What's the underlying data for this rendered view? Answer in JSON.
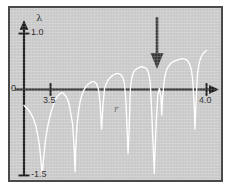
{
  "figure": {
    "background_color": "#ffffff",
    "plot_background_color": "#c9c9c9",
    "border_color": "#4a4a4a",
    "curve_color": "#ffffff",
    "axis_color": "#1c1c1c",
    "annotation_arrow_color": "#3a3a3a"
  },
  "labels": {
    "y_axis_symbol": "λ",
    "y_tick_top": "1.0",
    "y_tick_zero": "0",
    "y_tick_bottom": "-1.5",
    "x_axis_symbol": "r",
    "x_tick_left": "3.5",
    "x_tick_right": "4.0"
  },
  "annotations": [
    {
      "name": "period-3-window-arrow",
      "glyph": "down-arrow",
      "r": 3.8284,
      "description": "arrow marking period-3 window"
    }
  ],
  "chart_data": {
    "type": "line",
    "title": "",
    "subtitle": "",
    "xlabel": "r",
    "ylabel": "λ",
    "grid": false,
    "legend": null,
    "xlim": [
      3.4,
      4.02
    ],
    "ylim": [
      -1.5,
      1.0
    ],
    "xticks": [
      3.5,
      4.0
    ],
    "xticklabels": [
      "3.5",
      "4.0"
    ],
    "yticks": [
      -1.5,
      0,
      1.0
    ],
    "yticklabels": [
      "-1.5",
      "0",
      "1.0"
    ],
    "series": [
      {
        "name": "Lyapunov exponent of logistic map",
        "x": [
          3.4,
          3.41,
          3.42,
          3.43,
          3.44,
          3.45,
          3.455,
          3.46,
          3.465,
          3.47,
          3.475,
          3.48,
          3.485,
          3.49,
          3.495,
          3.5,
          3.505,
          3.51,
          3.515,
          3.52,
          3.525,
          3.53,
          3.535,
          3.54,
          3.545,
          3.55,
          3.56,
          3.565,
          3.568,
          3.57,
          3.575,
          3.58,
          3.585,
          3.59,
          3.595,
          3.6,
          3.605,
          3.61,
          3.615,
          3.62,
          3.625,
          3.63,
          3.635,
          3.64,
          3.645,
          3.65,
          3.655,
          3.66,
          3.665,
          3.67,
          3.675,
          3.68,
          3.685,
          3.69,
          3.695,
          3.7,
          3.705,
          3.71,
          3.715,
          3.72,
          3.725,
          3.73,
          3.735,
          3.74,
          3.742,
          3.745,
          3.748,
          3.75,
          3.755,
          3.76,
          3.765,
          3.77,
          3.775,
          3.78,
          3.785,
          3.79,
          3.795,
          3.8,
          3.805,
          3.81,
          3.815,
          3.82,
          3.825,
          3.828,
          3.8284,
          3.83,
          3.835,
          3.84,
          3.845,
          3.85,
          3.853,
          3.855,
          3.86,
          3.865,
          3.87,
          3.875,
          3.88,
          3.885,
          3.89,
          3.895,
          3.9,
          3.905,
          3.91,
          3.915,
          3.92,
          3.925,
          3.93,
          3.935,
          3.94,
          3.945,
          3.95,
          3.955,
          3.96,
          3.962,
          3.965,
          3.97,
          3.975,
          3.98,
          3.985,
          3.99,
          3.995,
          4.0
        ],
        "y": [
          -0.28,
          -0.33,
          -0.4,
          -0.5,
          -0.66,
          -0.95,
          -1.2,
          -1.5,
          -1.18,
          -0.92,
          -0.74,
          -0.6,
          -0.48,
          -0.38,
          -0.29,
          -0.22,
          -0.16,
          -0.12,
          -0.09,
          -0.07,
          -0.06,
          -0.07,
          -0.1,
          -0.14,
          -0.2,
          -0.3,
          -0.62,
          -1.05,
          -1.45,
          -1.05,
          -0.58,
          -0.36,
          -0.2,
          -0.1,
          -0.03,
          0.02,
          0.06,
          0.09,
          0.11,
          0.13,
          0.14,
          0.14,
          0.12,
          0.08,
          0.0,
          -0.22,
          -0.7,
          -0.25,
          0.02,
          0.1,
          0.15,
          0.19,
          0.22,
          0.24,
          0.26,
          0.27,
          0.28,
          0.28,
          0.27,
          0.25,
          0.21,
          0.12,
          -0.2,
          -0.85,
          -1.12,
          -0.8,
          -0.3,
          0.05,
          0.22,
          0.3,
          0.34,
          0.36,
          0.38,
          0.39,
          0.4,
          0.4,
          0.39,
          0.38,
          0.35,
          0.28,
          0.12,
          -0.4,
          -1.05,
          -1.4,
          -1.48,
          -1.2,
          -0.55,
          -0.1,
          0.02,
          -0.12,
          -0.45,
          -0.2,
          0.12,
          0.28,
          0.36,
          0.41,
          0.44,
          0.47,
          0.49,
          0.5,
          0.51,
          0.52,
          0.53,
          0.54,
          0.54,
          0.54,
          0.53,
          0.52,
          0.49,
          0.44,
          0.35,
          0.16,
          -0.35,
          -0.7,
          -0.3,
          0.25,
          0.45,
          0.54,
          0.6,
          0.64,
          0.67,
          0.693
        ]
      }
    ]
  }
}
